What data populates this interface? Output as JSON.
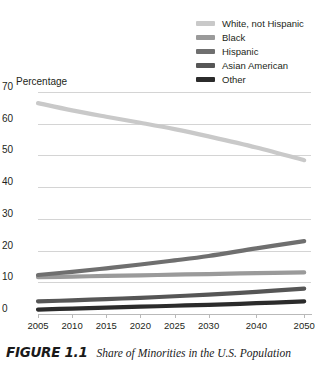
{
  "axis_title": "Percentage",
  "caption": {
    "figure_number": "FIGURE 1.1",
    "title": "Share of Minorities in the U.S. Population"
  },
  "legend": {
    "items": [
      {
        "label": "White, not Hispanic",
        "color": "#c9c9c9"
      },
      {
        "label": "Black",
        "color": "#9a9a9a"
      },
      {
        "label": "Hispanic",
        "color": "#6f6f6f"
      },
      {
        "label": "Asian American",
        "color": "#565656"
      },
      {
        "label": "Other",
        "color": "#2b2b2b"
      }
    ]
  },
  "chart_data": {
    "type": "line",
    "title": "Share of Minorities in the U.S. Population",
    "xlabel": "",
    "ylabel": "Percentage",
    "ylim": [
      0,
      70
    ],
    "yticks": [
      "0",
      "10",
      "20",
      "30",
      "40",
      "50",
      "60",
      "70"
    ],
    "x": [
      2005,
      2010,
      2015,
      2020,
      2025,
      2030,
      2040,
      2050
    ],
    "xtick_labels": [
      "2005",
      "2010",
      "2015",
      "2020",
      "2025",
      "2030",
      "2040",
      "2050"
    ],
    "grid": true,
    "legend_position": "top-right",
    "series": [
      {
        "name": "White, not Hispanic",
        "color": "#c9c9c9",
        "values": [
          66.5,
          64.2,
          62.2,
          60.3,
          58.3,
          56.0,
          52.5,
          48.5
        ]
      },
      {
        "name": "Black",
        "color": "#9a9a9a",
        "values": [
          11.6,
          11.8,
          12.0,
          12.2,
          12.4,
          12.6,
          12.9,
          13.1
        ]
      },
      {
        "name": "Hispanic",
        "color": "#6f6f6f",
        "values": [
          12.3,
          13.3,
          14.4,
          15.6,
          16.9,
          18.3,
          20.7,
          23.0
        ]
      },
      {
        "name": "Asian American",
        "color": "#565656",
        "values": [
          4.0,
          4.3,
          4.7,
          5.1,
          5.6,
          6.1,
          7.0,
          8.0
        ]
      },
      {
        "name": "Other",
        "color": "#2b2b2b",
        "values": [
          1.4,
          1.7,
          2.0,
          2.3,
          2.6,
          2.9,
          3.4,
          4.0
        ]
      }
    ]
  }
}
